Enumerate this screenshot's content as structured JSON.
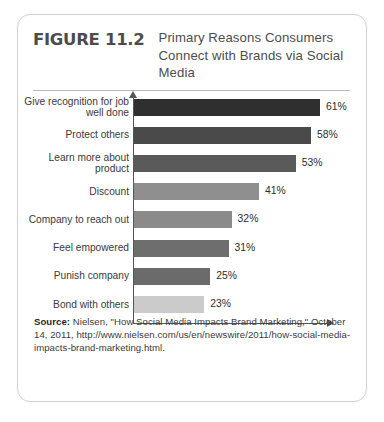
{
  "figure": {
    "number": "FIGURE 11.2",
    "title": "Primary Reasons Consumers Connect with Brands via Social Media"
  },
  "source": {
    "label": "Source:",
    "text": " Nielsen, \"How Social Media Impacts Brand Marketing,\" October 14, 2011, http://www.nielsen.com/us/en/newswire/2011/how-social-media-impacts-brand-marketing.html."
  },
  "chart_data": {
    "type": "bar",
    "orientation": "horizontal",
    "title": "Primary Reasons Consumers Connect with Brands via Social Media",
    "xlabel": "",
    "ylabel": "",
    "xlim": [
      0,
      65
    ],
    "grid": false,
    "legend": false,
    "categories": [
      "Give recognition for job well done",
      "Protect others",
      "Learn more about product",
      "Discount",
      "Company to reach out",
      "Feel empowered",
      "Punish company",
      "Bond with others"
    ],
    "values": [
      61,
      58,
      53,
      41,
      32,
      31,
      25,
      23
    ],
    "value_labels": [
      "61%",
      "58%",
      "53%",
      "41%",
      "32%",
      "31%",
      "25%",
      "23%"
    ],
    "bar_colors": [
      "#2f2f2f",
      "#4a4a4a",
      "#5a5a5a",
      "#8f8f8f",
      "#8a8a8a",
      "#6e6e6e",
      "#6b6b6b",
      "#cbcbcb"
    ]
  }
}
